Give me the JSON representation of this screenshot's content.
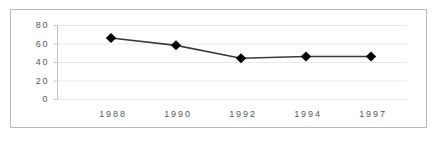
{
  "chart_data": {
    "type": "line",
    "title": "",
    "xlabel": "",
    "ylabel": "",
    "categories": [
      "1988",
      "1990",
      "1992",
      "1994",
      "1997"
    ],
    "values": [
      66,
      58,
      44,
      46,
      46
    ],
    "series": [
      {
        "name": "series-1",
        "values": [
          66,
          58,
          44,
          46,
          46
        ],
        "marker": "diamond",
        "marker_color": "#000000",
        "line_color": "#3b3b3b"
      }
    ],
    "ylim": [
      0,
      80
    ],
    "yticks": [
      0,
      20,
      40,
      60,
      80
    ],
    "ytick_labels": [
      "0",
      "20",
      "40",
      "60",
      "80"
    ],
    "xtick_labels": [
      "1988",
      "1990",
      "1992",
      "1994",
      "1997"
    ],
    "grid": "horizontal",
    "gridline_color": "#e9e9e9",
    "axis_color": "#c3c3c3",
    "legend": "none",
    "border_color": "#b9b9b9",
    "background": "#ffffff"
  }
}
